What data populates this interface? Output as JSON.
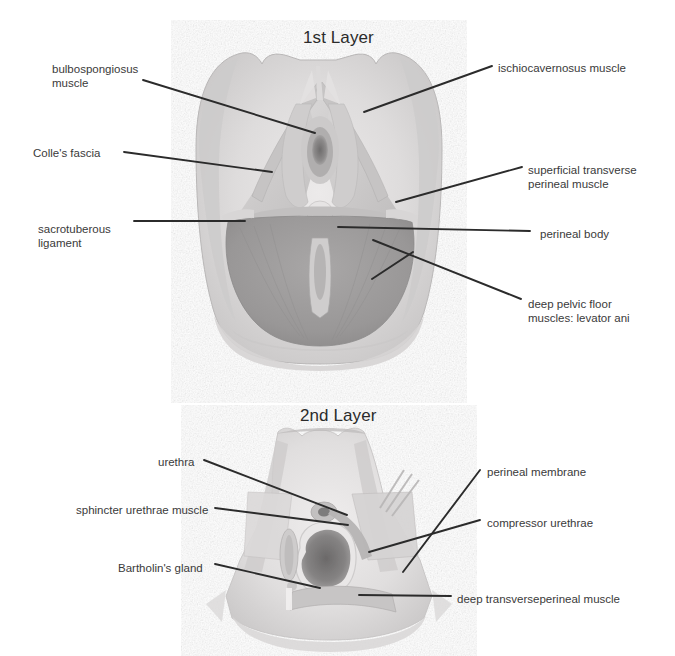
{
  "page": {
    "background_color": "#ffffff",
    "width": 675,
    "height": 656,
    "text_color": "#3a3a3a",
    "leader_line_color": "#2b2b2b"
  },
  "figures": [
    {
      "id": "first-layer",
      "title": "1st Layer",
      "title_x": 303,
      "title_y": 28,
      "labels": [
        {
          "id": "bulbospongiosus-muscle",
          "text": "bulbospongiosus\nmuscle",
          "side": "left",
          "text_x": 52,
          "text_y": 62,
          "line": [
            [
              143,
              80
            ],
            [
              315,
              133
            ]
          ]
        },
        {
          "id": "colles-fascia",
          "text": "Colle's fascia",
          "side": "left",
          "text_x": 33,
          "text_y": 146,
          "line": [
            [
              124,
              152
            ],
            [
              272,
              172
            ]
          ]
        },
        {
          "id": "sacrotuberous-ligament",
          "text": "sacrotuberous\nligament",
          "side": "left",
          "text_x": 38,
          "text_y": 222,
          "line": [
            [
              134,
              221
            ],
            [
              245,
              221
            ]
          ]
        },
        {
          "id": "ischiocavernosus-muscle",
          "text": "ischiocavernosus muscle",
          "side": "right",
          "text_x": 498,
          "text_y": 61,
          "line": [
            [
              492,
              66
            ],
            [
              364,
              112
            ]
          ]
        },
        {
          "id": "superficial-transverse-perineal-muscle",
          "text": "superficial transverse\nperineal muscle",
          "side": "right",
          "text_x": 528,
          "text_y": 163,
          "line": [
            [
              522,
              167
            ],
            [
              396,
              202
            ]
          ]
        },
        {
          "id": "perineal-body",
          "text": "perineal body",
          "side": "right",
          "text_x": 540,
          "text_y": 227,
          "line": [
            [
              530,
              231
            ],
            [
              338,
              227
            ]
          ]
        },
        {
          "id": "deep-pelvic-floor-muscles-levator-ani",
          "text": "deep pelvic floor\nmuscles: levator ani",
          "side": "right",
          "text_x": 528,
          "text_y": 297,
          "line": [
            [
              521,
              299
            ],
            [
              373,
              240
            ]
          ],
          "line2": [
            [
              372,
              279
            ],
            [
              413,
              252
            ]
          ]
        }
      ]
    },
    {
      "id": "second-layer",
      "title": "2nd Layer",
      "title_x": 300,
      "title_y": 406,
      "labels": [
        {
          "id": "urethra",
          "text": "urethra",
          "side": "left",
          "text_x": 158,
          "text_y": 455,
          "line": [
            [
              204,
              460
            ],
            [
              347,
              515
            ]
          ]
        },
        {
          "id": "sphincter-urethrae-muscle",
          "text": "sphincter urethrae muscle",
          "side": "left",
          "text_x": 76,
          "text_y": 503,
          "line": [
            [
              215,
              508
            ],
            [
              348,
              525
            ]
          ]
        },
        {
          "id": "bartholins-gland",
          "text": "Bartholin's gland",
          "side": "left",
          "text_x": 118,
          "text_y": 561,
          "line": [
            [
              215,
              564
            ],
            [
              320,
              588
            ]
          ]
        },
        {
          "id": "perineal-membrane",
          "text": "perineal membrane",
          "side": "right",
          "text_x": 487,
          "text_y": 465,
          "line": [
            [
              480,
              470
            ],
            [
              403,
              572
            ]
          ]
        },
        {
          "id": "compressor-urethrae",
          "text": "compressor urethrae",
          "side": "right",
          "text_x": 487,
          "text_y": 516,
          "line": [
            [
              480,
              520
            ],
            [
              369,
              552
            ]
          ]
        },
        {
          "id": "deep-transverseperineal-muscle",
          "text": "deep transverseperineal muscle",
          "side": "right",
          "text_x": 457,
          "text_y": 592,
          "line": [
            [
              451,
              596
            ],
            [
              359,
              595
            ]
          ]
        }
      ]
    }
  ]
}
